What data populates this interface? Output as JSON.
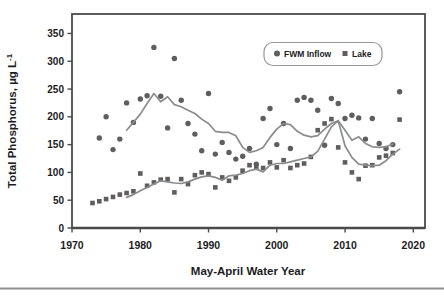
{
  "chart_data": {
    "type": "scatter",
    "title": "",
    "xlabel": "May-April Water Year",
    "ylabel_main": "Total Phosphorus, µg L",
    "ylabel_sup": "-1",
    "xlim": [
      1970,
      2021.7
    ],
    "ylim": [
      0,
      385
    ],
    "x_ticks": [
      1970,
      1980,
      1990,
      2000,
      2010,
      2020
    ],
    "y_ticks": [
      0,
      50,
      100,
      150,
      200,
      250,
      300,
      350
    ],
    "grid": false,
    "legend_position": "top-center-inside",
    "series": [
      {
        "name": "FWM Inflow",
        "kind": "scatter",
        "marker": "circle",
        "points": [
          [
            1974,
            162
          ],
          [
            1975,
            200
          ],
          [
            1976,
            141
          ],
          [
            1977,
            160
          ],
          [
            1978,
            225
          ],
          [
            1979,
            190
          ],
          [
            1980,
            232
          ],
          [
            1981,
            238
          ],
          [
            1982,
            325
          ],
          [
            1983,
            237
          ],
          [
            1984,
            180
          ],
          [
            1985,
            305
          ],
          [
            1986,
            230
          ],
          [
            1987,
            188
          ],
          [
            1988,
            169
          ],
          [
            1989,
            139
          ],
          [
            1990,
            242
          ],
          [
            1991,
            133
          ],
          [
            1992,
            154
          ],
          [
            1993,
            136
          ],
          [
            1994,
            124
          ],
          [
            1995,
            129
          ],
          [
            1996,
            143
          ],
          [
            1997,
            115
          ],
          [
            1998,
            197
          ],
          [
            1999,
            215
          ],
          [
            2000,
            150
          ],
          [
            2001,
            188
          ],
          [
            2002,
            143
          ],
          [
            2003,
            230
          ],
          [
            2004,
            235
          ],
          [
            2005,
            230
          ],
          [
            2006,
            212
          ],
          [
            2007,
            149
          ],
          [
            2008,
            233
          ],
          [
            2009,
            224
          ],
          [
            2010,
            197
          ],
          [
            2011,
            203
          ],
          [
            2012,
            198
          ],
          [
            2013,
            160
          ],
          [
            2014,
            197
          ],
          [
            2015,
            152
          ],
          [
            2016,
            143
          ],
          [
            2017,
            150
          ],
          [
            2018,
            245
          ]
        ]
      },
      {
        "name": "Lake",
        "kind": "scatter",
        "marker": "square",
        "points": [
          [
            1973,
            45
          ],
          [
            1974,
            48
          ],
          [
            1975,
            52
          ],
          [
            1976,
            56
          ],
          [
            1977,
            60
          ],
          [
            1978,
            63
          ],
          [
            1979,
            66
          ],
          [
            1980,
            98
          ],
          [
            1981,
            76
          ],
          [
            1982,
            82
          ],
          [
            1983,
            87
          ],
          [
            1984,
            88
          ],
          [
            1985,
            64
          ],
          [
            1986,
            88
          ],
          [
            1987,
            79
          ],
          [
            1988,
            95
          ],
          [
            1989,
            100
          ],
          [
            1990,
            97
          ],
          [
            1991,
            73
          ],
          [
            1992,
            91
          ],
          [
            1993,
            85
          ],
          [
            1994,
            91
          ],
          [
            1995,
            103
          ],
          [
            1996,
            113
          ],
          [
            1997,
            110
          ],
          [
            1998,
            108
          ],
          [
            1999,
            118
          ],
          [
            2000,
            109
          ],
          [
            2001,
            122
          ],
          [
            2002,
            108
          ],
          [
            2003,
            113
          ],
          [
            2004,
            116
          ],
          [
            2005,
            128
          ],
          [
            2006,
            176
          ],
          [
            2007,
            188
          ],
          [
            2008,
            196
          ],
          [
            2009,
            145
          ],
          [
            2010,
            118
          ],
          [
            2011,
            100
          ],
          [
            2012,
            88
          ],
          [
            2013,
            112
          ],
          [
            2014,
            113
          ],
          [
            2015,
            127
          ],
          [
            2016,
            130
          ],
          [
            2017,
            135
          ],
          [
            2018,
            195
          ]
        ]
      },
      {
        "name": "FWM Inflow smoothed",
        "kind": "line",
        "points": [
          [
            1978,
            176
          ],
          [
            1979,
            190
          ],
          [
            1980,
            205
          ],
          [
            1981,
            224
          ],
          [
            1982,
            242
          ],
          [
            1983,
            227
          ],
          [
            1984,
            236
          ],
          [
            1985,
            222
          ],
          [
            1986,
            218
          ],
          [
            1987,
            212
          ],
          [
            1988,
            206
          ],
          [
            1989,
            196
          ],
          [
            1990,
            188
          ],
          [
            1991,
            174
          ],
          [
            1992,
            172
          ],
          [
            1993,
            172
          ],
          [
            1994,
            166
          ],
          [
            1995,
            145
          ],
          [
            1996,
            136
          ],
          [
            1997,
            139
          ],
          [
            1998,
            145
          ],
          [
            1999,
            163
          ],
          [
            2000,
            178
          ],
          [
            2001,
            188
          ],
          [
            2002,
            186
          ],
          [
            2003,
            174
          ],
          [
            2004,
            167
          ],
          [
            2005,
            164
          ],
          [
            2006,
            166
          ],
          [
            2007,
            178
          ],
          [
            2008,
            188
          ],
          [
            2009,
            193
          ],
          [
            2010,
            176
          ],
          [
            2011,
            158
          ],
          [
            2012,
            164
          ],
          [
            2013,
            152
          ],
          [
            2014,
            146
          ],
          [
            2015,
            145
          ],
          [
            2016,
            146
          ],
          [
            2017,
            151
          ]
        ]
      },
      {
        "name": "Lake smoothed",
        "kind": "line",
        "points": [
          [
            1978,
            55
          ],
          [
            1979,
            60
          ],
          [
            1980,
            67
          ],
          [
            1981,
            73
          ],
          [
            1982,
            79
          ],
          [
            1983,
            85
          ],
          [
            1984,
            83
          ],
          [
            1985,
            81
          ],
          [
            1986,
            80
          ],
          [
            1987,
            83
          ],
          [
            1988,
            88
          ],
          [
            1989,
            92
          ],
          [
            1990,
            94
          ],
          [
            1991,
            91
          ],
          [
            1992,
            86
          ],
          [
            1993,
            94
          ],
          [
            1994,
            95
          ],
          [
            1995,
            98
          ],
          [
            1996,
            103
          ],
          [
            1997,
            106
          ],
          [
            1998,
            101
          ],
          [
            1999,
            113
          ],
          [
            2000,
            116
          ],
          [
            2001,
            116
          ],
          [
            2002,
            119
          ],
          [
            2003,
            122
          ],
          [
            2004,
            125
          ],
          [
            2005,
            128
          ],
          [
            2006,
            138
          ],
          [
            2007,
            160
          ],
          [
            2008,
            182
          ],
          [
            2009,
            193
          ],
          [
            2010,
            148
          ],
          [
            2011,
            127
          ],
          [
            2012,
            115
          ],
          [
            2013,
            113
          ],
          [
            2014,
            112
          ],
          [
            2015,
            113
          ],
          [
            2016,
            121
          ],
          [
            2017,
            133
          ],
          [
            2018,
            142
          ]
        ]
      }
    ]
  },
  "colors": {
    "marker": "#605d5d",
    "trend_line": "#8a8c8e",
    "axis": "#4a4a4c",
    "text": "#1c1c1e",
    "legend_border": "#95979a",
    "page_divider": "#8d8f92"
  }
}
